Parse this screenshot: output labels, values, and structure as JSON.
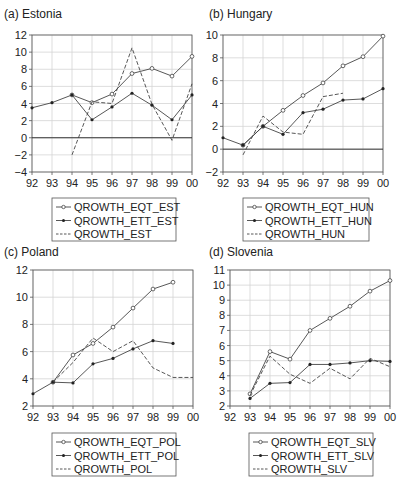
{
  "chart_data": [
    {
      "type": "line",
      "title": "(a) Estonia",
      "xlabel": "",
      "ylabel": "",
      "categories": [
        "92",
        "93",
        "94",
        "95",
        "96",
        "97",
        "98",
        "99",
        "00"
      ],
      "ylim": [
        -4,
        12
      ],
      "yticks": [
        -4,
        -2,
        0,
        2,
        4,
        6,
        8,
        10,
        12
      ],
      "grid": true,
      "legend_position": "below",
      "series": [
        {
          "name": "QROWTH_EQT_EST",
          "style": "open-circle",
          "values": [
            null,
            null,
            5.0,
            4.1,
            5.1,
            7.5,
            8.1,
            7.2,
            9.5
          ]
        },
        {
          "name": "QROWTH_ETT_EST",
          "style": "filled-dot",
          "values": [
            3.5,
            4.1,
            5.0,
            2.1,
            3.6,
            5.2,
            3.8,
            2.1,
            5.0
          ]
        },
        {
          "name": "QROWTH_EST",
          "style": "dashed",
          "values": [
            null,
            null,
            -2.0,
            4.2,
            4.0,
            10.5,
            3.9,
            -0.3,
            6.3
          ]
        }
      ]
    },
    {
      "type": "line",
      "title": "(b) Hungary",
      "xlabel": "",
      "ylabel": "",
      "categories": [
        "92",
        "93",
        "94",
        "95",
        "96",
        "97",
        "98",
        "99",
        "00"
      ],
      "ylim": [
        -2,
        10
      ],
      "yticks": [
        -2,
        0,
        2,
        4,
        6,
        8,
        10
      ],
      "grid": true,
      "legend_position": "below",
      "series": [
        {
          "name": "QROWTH_EQT_HUN",
          "style": "open-circle",
          "values": [
            null,
            0.35,
            2.0,
            3.4,
            4.7,
            5.8,
            7.3,
            8.1,
            9.9
          ]
        },
        {
          "name": "QROWTH_ETT_HUN",
          "style": "filled-dot",
          "values": [
            1.0,
            0.35,
            2.0,
            1.3,
            3.2,
            3.5,
            4.3,
            4.4,
            5.3
          ]
        },
        {
          "name": "QROWTH_HUN",
          "style": "dashed",
          "values": [
            null,
            -0.5,
            2.9,
            1.5,
            1.3,
            4.6,
            4.9,
            null,
            null
          ]
        }
      ]
    },
    {
      "type": "line",
      "title": "(c) Poland",
      "xlabel": "",
      "ylabel": "",
      "categories": [
        "92",
        "93",
        "94",
        "95",
        "96",
        "97",
        "98",
        "99",
        "00"
      ],
      "ylim": [
        2,
        12
      ],
      "yticks": [
        2,
        4,
        6,
        8,
        10,
        12
      ],
      "grid": true,
      "legend_position": "below",
      "series": [
        {
          "name": "QROWTH_EQT_POL",
          "style": "open-circle",
          "values": [
            null,
            3.75,
            5.75,
            6.6,
            7.8,
            9.2,
            10.6,
            11.1,
            null
          ]
        },
        {
          "name": "QROWTH_ETT_POL",
          "style": "filled-dot",
          "values": [
            2.9,
            3.75,
            3.7,
            5.1,
            5.5,
            6.2,
            6.8,
            6.6,
            null
          ]
        },
        {
          "name": "QROWTH_POL",
          "style": "dashed",
          "values": [
            null,
            3.75,
            5.2,
            7.0,
            6.0,
            6.8,
            4.8,
            4.1,
            4.1
          ]
        }
      ]
    },
    {
      "type": "line",
      "title": "(d) Slovenia",
      "xlabel": "",
      "ylabel": "",
      "categories": [
        "92",
        "93",
        "94",
        "95",
        "96",
        "97",
        "98",
        "99",
        "00"
      ],
      "ylim": [
        2,
        11
      ],
      "yticks": [
        2,
        3,
        4,
        5,
        6,
        7,
        8,
        9,
        10,
        11
      ],
      "grid": true,
      "legend_position": "below",
      "series": [
        {
          "name": "QROWTH_EQT_SLV",
          "style": "open-circle",
          "values": [
            null,
            2.8,
            5.6,
            5.1,
            7.0,
            7.8,
            8.6,
            9.6,
            10.3
          ]
        },
        {
          "name": "QROWTH_ETT_SLV",
          "style": "filled-dot",
          "values": [
            null,
            2.5,
            3.5,
            3.55,
            4.75,
            4.75,
            4.85,
            5.0,
            4.95
          ]
        },
        {
          "name": "QROWTH_SLV",
          "style": "dashed",
          "values": [
            null,
            2.7,
            5.3,
            4.1,
            3.5,
            4.5,
            3.8,
            5.15,
            4.6
          ]
        }
      ]
    }
  ],
  "colors": {
    "line": "#444444",
    "grid": "#d4d4d4",
    "axis": "#555555",
    "text": "#222222"
  }
}
